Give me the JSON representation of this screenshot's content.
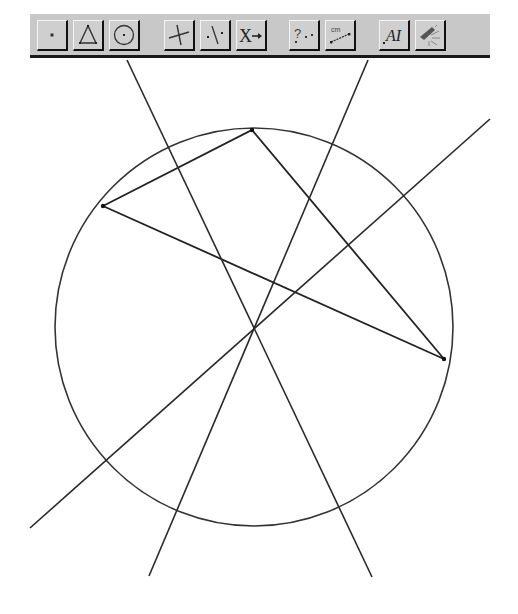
{
  "app": {
    "name": "Geometry sketch toolbox"
  },
  "toolbar": {
    "buttons": [
      {
        "id": "point-tool",
        "icon": "point-icon"
      },
      {
        "id": "polygon-tool",
        "icon": "triangle-icon"
      },
      {
        "id": "circle-tool",
        "icon": "circle-icon"
      },
      {
        "id": "perpendicular-tool",
        "icon": "perpendicular-lines-icon"
      },
      {
        "id": "midpoint-tool",
        "icon": "line-midpoint-icon"
      },
      {
        "id": "transform-tool",
        "icon": "transform-arrow-icon",
        "label": "X"
      },
      {
        "id": "check-property-tool",
        "icon": "question-points-icon",
        "label": "?"
      },
      {
        "id": "measure-tool",
        "icon": "measure-cm-icon",
        "label": "cm"
      },
      {
        "id": "text-tool",
        "icon": "text-label-icon",
        "label": "AI"
      },
      {
        "id": "display-tool",
        "icon": "brush-light-icon"
      }
    ]
  },
  "figure": {
    "circle": {
      "cx": 254,
      "cy": 327,
      "r": 199,
      "color": "#333333"
    },
    "triangle": {
      "vertices": [
        {
          "name": "A",
          "x": 103,
          "y": 206
        },
        {
          "name": "B",
          "x": 252,
          "y": 130
        },
        {
          "name": "C",
          "x": 444,
          "y": 359
        }
      ],
      "color": "#222222"
    },
    "lines": [
      {
        "name": "perpendicular-bisector-AC",
        "x1": 490,
        "y1": 119,
        "x2": 30,
        "y2": 528
      },
      {
        "name": "perpendicular-bisector-AB",
        "x1": 368,
        "y1": 60,
        "x2": 149,
        "y2": 576
      },
      {
        "name": "perpendicular-bisector-BC",
        "x1": 127,
        "y1": 60,
        "x2": 372,
        "y2": 577
      }
    ],
    "circumcenter": {
      "x": 253,
      "y": 328
    },
    "stroke_color": "#2a2a2a"
  }
}
